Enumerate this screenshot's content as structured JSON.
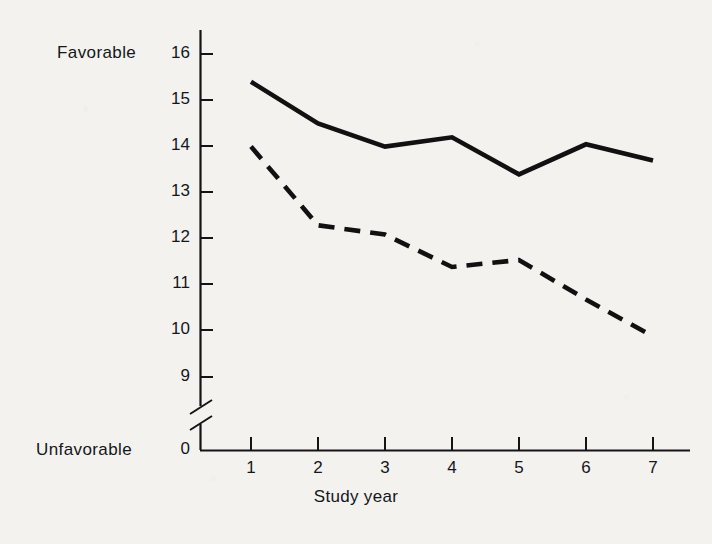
{
  "chart_data": {
    "type": "line",
    "title": "",
    "xlabel": "Study year",
    "ylabel": "",
    "y_axis_top_label": "Favorable",
    "y_axis_bottom_label": "Unfavorable",
    "x": [
      1,
      2,
      3,
      4,
      5,
      6,
      7
    ],
    "xtick_labels": [
      "1",
      "2",
      "3",
      "4",
      "5",
      "6",
      "7"
    ],
    "ytick_labels": [
      "0",
      "9",
      "10",
      "11",
      "12",
      "13",
      "14",
      "15",
      "16"
    ],
    "ylim": [
      9,
      16
    ],
    "xlim": [
      0.6,
      7.4
    ],
    "y_axis_break": true,
    "y_axis_break_between": [
      "0",
      "9"
    ],
    "grid": false,
    "legend": "none",
    "series": [
      {
        "name": "solid-line",
        "style": "solid",
        "color": "#111111",
        "values": [
          15.4,
          14.5,
          14.0,
          14.2,
          13.4,
          14.05,
          13.7
        ]
      },
      {
        "name": "dashed-line",
        "style": "dashed",
        "color": "#111111",
        "values": [
          14.0,
          12.3,
          12.1,
          11.4,
          11.55,
          10.7,
          9.9
        ]
      }
    ]
  },
  "axis": {
    "favorable_label": "Favorable",
    "unfavorable_label": "Unfavorable",
    "x_title": "Study year",
    "zero_label": "0"
  },
  "colors": {
    "background": "#f3f2ef",
    "ink": "#111111"
  }
}
